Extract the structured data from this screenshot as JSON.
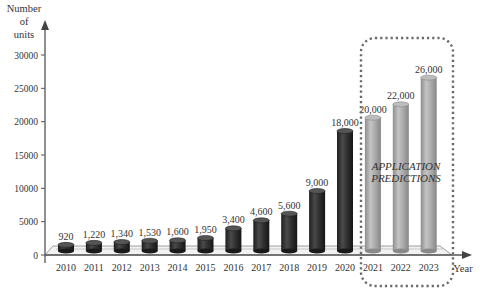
{
  "chart_data": {
    "type": "bar",
    "title": "",
    "xlabel": "Year",
    "ylabel": "Number of units",
    "ylabel_lines": [
      "Number",
      "of",
      "units"
    ],
    "ylim": [
      0,
      30000
    ],
    "yticks": [
      0,
      5000,
      10000,
      15000,
      20000,
      25000,
      30000
    ],
    "grid": false,
    "categories": [
      "2010",
      "2011",
      "2012",
      "2013",
      "2014",
      "2015",
      "2016",
      "2017",
      "2018",
      "2019",
      "2020",
      "2021",
      "2022",
      "2023"
    ],
    "values": [
      920,
      1220,
      1340,
      1530,
      1600,
      1950,
      3400,
      4600,
      5600,
      9000,
      18000,
      20000,
      22000,
      26000
    ],
    "value_labels": [
      "920",
      "1,220",
      "1,340",
      "1,530",
      "1,600",
      "1,950",
      "3,400",
      "4,600",
      "5,600",
      "9,000",
      "18,000",
      "20,000",
      "22,000",
      "26,000"
    ],
    "series": [
      {
        "name": "Actual",
        "range": [
          "2010",
          "2020"
        ],
        "color": "#2f2f2f"
      },
      {
        "name": "Predicted",
        "range": [
          "2021",
          "2023"
        ],
        "color": "#a9a9a9"
      }
    ],
    "annotations": [
      {
        "text_lines": [
          "APPLICATION",
          "PREDICTIONS"
        ],
        "region": [
          "2021",
          "2023"
        ],
        "style": "dotted rounded box"
      }
    ]
  },
  "colors": {
    "actual_bar": "#2f2f2f",
    "predicted_bar": "#a9a9a9",
    "axis": "#555555",
    "box_dots": "#6a6a6a"
  }
}
